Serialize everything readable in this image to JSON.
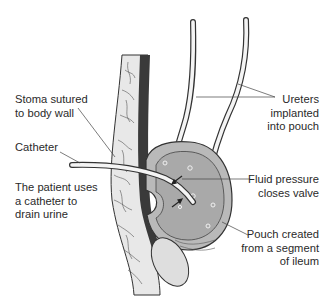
{
  "figure": {
    "colors": {
      "outline": "#333333",
      "pouch_fill": "#b9b9b9",
      "pouch_inner_fill": "#a9a9a9",
      "tissue_fill": "#e8e8e8",
      "muscle_dark": "#3a3a3a",
      "tube_fill": "#f4f4f4",
      "label_text": "#2a2a2a",
      "leader_line": "#444444"
    }
  },
  "labels": {
    "stoma": "Stoma sutured\nto body wall",
    "catheter": "Catheter",
    "patient": "The patient uses\na catheter to\ndrain urine",
    "ureters": "Ureters\nimplanted\ninto pouch",
    "fluid": "Fluid pressure\ncloses valve",
    "pouch": "Pouch created\nfrom a segment\nof ileum"
  }
}
